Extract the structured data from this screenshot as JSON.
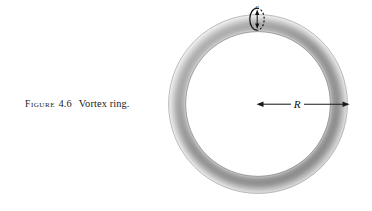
{
  "figure": {
    "caption_word": "Figure",
    "caption_number": "4.6",
    "caption_title": "Vortex ring.",
    "background_color": "#ffffff",
    "ink_color": "#1a1a1a"
  },
  "diagram": {
    "kind": "vortex-ring-torus",
    "torus": {
      "center_x": 258,
      "center_y": 104,
      "major_radius": 81,
      "tube_radius": 9,
      "fill_light": "#d8d8d8",
      "fill_mid": "#a8a8a8",
      "fill_dark": "#8a8a8a",
      "edge_color": "#6f6f6f"
    },
    "labels": {
      "major_radius_label": "R",
      "tube_radius_label": "a"
    },
    "annotations": {
      "radius_arrow": {
        "from_x": 258,
        "to_x": 348,
        "y": 104,
        "style": "double-headed",
        "label": "R",
        "label_x": 297,
        "label_y": 104
      },
      "cross_section": {
        "center_x": 257,
        "center_y": 19,
        "rx": 7,
        "ry": 11,
        "solid_side": "left",
        "dashed_side": "right",
        "arrow_style": "double-headed-vertical",
        "label": "a",
        "label_x": 257,
        "label_y": 10
      }
    }
  }
}
